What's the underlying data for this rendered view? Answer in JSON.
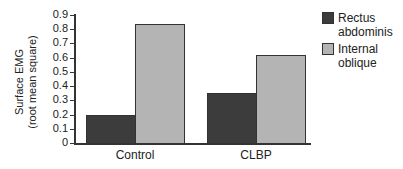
{
  "chart_data": {
    "type": "bar",
    "title": "",
    "xlabel": "",
    "ylabel_line1": "Surface EMG",
    "ylabel_line2": "(root mean square)",
    "ylim": [
      0,
      0.9
    ],
    "yticks": [
      "0",
      "0.1",
      "0.2",
      "0.3",
      "0.4",
      "0.5",
      "0.6",
      "0.7",
      "0.8",
      "0.9"
    ],
    "categories": [
      "Control",
      "CLBP"
    ],
    "series": [
      {
        "name": "Rectus abdominis",
        "line1": "Rectus",
        "line2": "abdominis",
        "color": "#3c3c3c",
        "values": [
          0.2,
          0.35
        ]
      },
      {
        "name": "Internal oblique",
        "line1": "Internal",
        "line2": "oblique",
        "color": "#b4b4b4",
        "values": [
          0.84,
          0.62
        ]
      }
    ],
    "grid": false,
    "legend_position": "right"
  }
}
